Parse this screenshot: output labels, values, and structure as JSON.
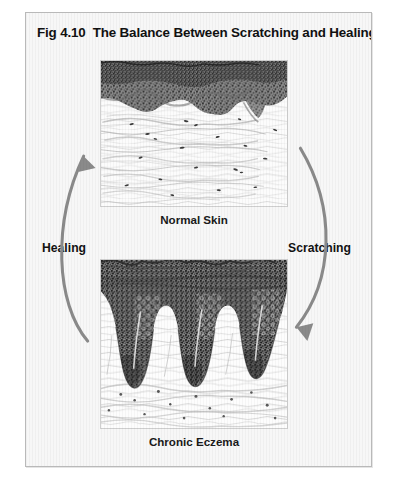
{
  "figure": {
    "number": "Fig 4.10",
    "title": "The Balance Between Scratching and Healing",
    "frame_color": "#b9b9b9",
    "background_color": "#f7f7f7"
  },
  "panels": [
    {
      "id": "normal-skin",
      "caption": "Normal Skin",
      "description": "Histology micrograph illustration of normal skin: a thin, evenly stippled dark epidermis with a gently undulating dermo-epidermal junction sitting above a pale dermis of wavy collagen bundles and scattered nuclei.",
      "epidermis_color": "#4b4b4b",
      "dermis_color": "#9b9b9b"
    },
    {
      "id": "chronic-eczema",
      "caption": "Chronic Eczema",
      "description": "Histology micrograph illustration of chronic eczema: a markedly thickened (acanthotic) dark epidermis with deep elongated rete ridges projecting into the dermis, overlying hyperkeratosis and an inflamed papillary dermis.",
      "epidermis_color": "#3c3c3c",
      "dermis_color": "#9b9b9b"
    }
  ],
  "cycle": {
    "arrows": [
      {
        "id": "healing",
        "label": "Healing",
        "direction": "upward",
        "from_panel": "chronic-eczema",
        "to_panel": "normal-skin",
        "color": "#8a8a8a"
      },
      {
        "id": "scratching",
        "label": "Scratching",
        "direction": "downward",
        "from_panel": "normal-skin",
        "to_panel": "chronic-eczema",
        "color": "#8a8a8a"
      }
    ]
  }
}
